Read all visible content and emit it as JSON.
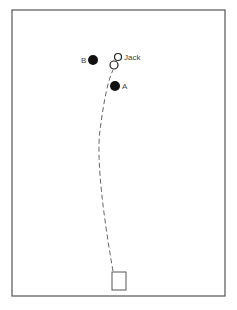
{
  "diagram": {
    "type": "bowls-green-layout",
    "frame": {
      "x": 12,
      "y": 10,
      "width": 213,
      "height": 286,
      "stroke": "#555555"
    },
    "jack": {
      "label": "Jack",
      "x": 118,
      "y": 57,
      "r": 3.5
    },
    "path_bowl": {
      "x": 114,
      "y": 65,
      "r": 4
    },
    "bowls": [
      {
        "label": "B",
        "x": 93,
        "y": 60,
        "r": 5,
        "fill": "#111111"
      },
      {
        "label": "A",
        "x": 115,
        "y": 86,
        "r": 5,
        "fill": "#111111"
      }
    ],
    "mat": {
      "x": 112,
      "y": 272,
      "width": 14,
      "height": 18
    },
    "trajectory": {
      "style": "dashed",
      "from": [
        113,
        272
      ],
      "to": [
        113,
        70
      ]
    }
  }
}
